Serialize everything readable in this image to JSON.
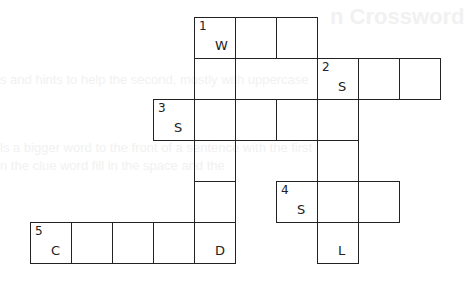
{
  "puzzle": {
    "ghost_text": {
      "title": "n Crossword",
      "lines": [
        "s and hints to help the second, mostly with uppercase",
        "ls a bigger word to the front of a sentence with the first",
        "n the clue word fill in the space and the"
      ]
    },
    "cell_size": 41,
    "origin": {
      "x": 194,
      "y": 17
    },
    "cells": [
      {
        "row": 0,
        "col": 0,
        "number": "1",
        "letter": "W"
      },
      {
        "row": 0,
        "col": 1,
        "number": "",
        "letter": ""
      },
      {
        "row": 0,
        "col": 2,
        "number": "",
        "letter": ""
      },
      {
        "row": 1,
        "col": 0,
        "number": "",
        "letter": ""
      },
      {
        "row": 1,
        "col": 3,
        "number": "2",
        "letter": "S"
      },
      {
        "row": 1,
        "col": 4,
        "number": "",
        "letter": ""
      },
      {
        "row": 1,
        "col": 5,
        "number": "",
        "letter": ""
      },
      {
        "row": 2,
        "col": -1,
        "number": "3",
        "letter": "S"
      },
      {
        "row": 2,
        "col": 0,
        "number": "",
        "letter": ""
      },
      {
        "row": 2,
        "col": 1,
        "number": "",
        "letter": ""
      },
      {
        "row": 2,
        "col": 2,
        "number": "",
        "letter": ""
      },
      {
        "row": 2,
        "col": 3,
        "number": "",
        "letter": ""
      },
      {
        "row": 3,
        "col": 0,
        "number": "",
        "letter": ""
      },
      {
        "row": 3,
        "col": 3,
        "number": "",
        "letter": ""
      },
      {
        "row": 4,
        "col": 0,
        "number": "",
        "letter": ""
      },
      {
        "row": 4,
        "col": 2,
        "number": "4",
        "letter": "S"
      },
      {
        "row": 4,
        "col": 3,
        "number": "",
        "letter": ""
      },
      {
        "row": 4,
        "col": 4,
        "number": "",
        "letter": ""
      },
      {
        "row": 5,
        "col": -4,
        "number": "5",
        "letter": "C"
      },
      {
        "row": 5,
        "col": -3,
        "number": "",
        "letter": ""
      },
      {
        "row": 5,
        "col": -2,
        "number": "",
        "letter": ""
      },
      {
        "row": 5,
        "col": -1,
        "number": "",
        "letter": ""
      },
      {
        "row": 5,
        "col": 0,
        "number": "",
        "letter": "D"
      },
      {
        "row": 5,
        "col": 3,
        "number": "",
        "letter": "L"
      }
    ],
    "extra_frames": [
      {
        "row": 1,
        "col": 1,
        "span": 2
      }
    ]
  }
}
